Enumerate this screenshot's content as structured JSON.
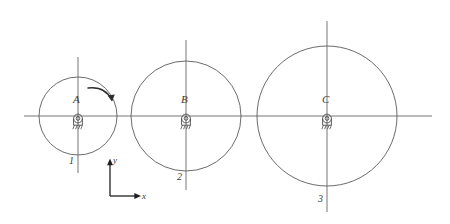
{
  "figure": {
    "background_color": "#ffffff",
    "line_color": "#555555",
    "axis_color": "#2b2b2b",
    "text_color": "#3a3a3a",
    "width": 450,
    "height": 224
  },
  "centerline": {
    "name": "horizontal-centerline",
    "y": 116,
    "x_start": 24,
    "x_end": 432
  },
  "discs": [
    {
      "id": "disc-1",
      "center_label": "A",
      "number_label": "1",
      "cx": 78,
      "cy": 116,
      "r": 39,
      "vline_top": 57,
      "vline_bottom": 173,
      "support_icon": "pin-support-icon"
    },
    {
      "id": "disc-2",
      "center_label": "B",
      "number_label": "2",
      "cx": 186,
      "cy": 116,
      "r": 55,
      "vline_top": 40,
      "vline_bottom": 190,
      "support_icon": "pin-support-icon"
    },
    {
      "id": "disc-3",
      "center_label": "C",
      "number_label": "3",
      "cx": 327,
      "cy": 116,
      "r": 70,
      "vline_top": 21,
      "vline_bottom": 212,
      "support_icon": "pin-support-icon"
    }
  ],
  "rotation_arrow": {
    "name": "rotation-arrow",
    "direction": "clockwise",
    "start_x": 88,
    "start_y": 88,
    "end_x": 114,
    "end_y": 103
  },
  "coordinate_frame": {
    "name": "coordinate-axes",
    "origin_x": 110,
    "origin_y": 196,
    "x_label": "x",
    "y_label": "y",
    "x_tip_x": 141,
    "y_tip_y": 159
  }
}
